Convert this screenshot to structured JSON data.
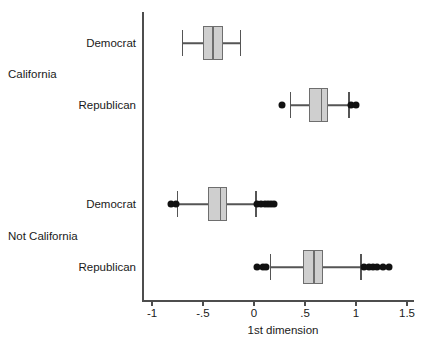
{
  "chart_data": {
    "type": "box",
    "title": "",
    "xlabel": "1st dimension",
    "ylabel": "",
    "orientation": "horizontal",
    "xlim": [
      -1.25,
      1.6
    ],
    "xticks": [
      -1,
      -0.5,
      0,
      0.5,
      1,
      1.5
    ],
    "xtick_labels": [
      "-1",
      "-.5",
      "0",
      ".5",
      "1",
      "1.5"
    ],
    "grid": false,
    "legend": false,
    "group_labels": [
      "California",
      "Not California"
    ],
    "category_labels": [
      "Democrat",
      "Republican",
      "Democrat",
      "Republican"
    ],
    "boxes": [
      {
        "group": "California",
        "category": "Democrat",
        "whisker_low": -0.7,
        "q1": -0.5,
        "median": -0.4,
        "q3": -0.3,
        "whisker_high": -0.13,
        "outliers": []
      },
      {
        "group": "California",
        "category": "Republican",
        "whisker_low": 0.36,
        "q1": 0.54,
        "median": 0.66,
        "q3": 0.73,
        "whisker_high": 0.93,
        "outliers": [
          0.27,
          0.95,
          1.0
        ]
      },
      {
        "group": "Not California",
        "category": "Democrat",
        "whisker_low": -0.75,
        "q1": -0.45,
        "median": -0.33,
        "q3": -0.26,
        "whisker_high": 0.02,
        "outliers": [
          -0.81,
          -0.76,
          0.03,
          0.07,
          0.11,
          0.14,
          0.17,
          0.2
        ]
      },
      {
        "group": "Not California",
        "category": "Republican",
        "whisker_low": 0.16,
        "q1": 0.48,
        "median": 0.59,
        "q3": 0.68,
        "whisker_high": 1.05,
        "outliers": [
          0.03,
          0.09,
          0.12,
          1.08,
          1.13,
          1.17,
          1.21,
          1.26,
          1.32
        ]
      }
    ],
    "colors": {
      "box_fill": "#cfcfcf",
      "box_edge": "#6e6e6e",
      "whisker": "#555555",
      "outlier": "#111111",
      "axis": "#4d4d4d",
      "text": "#1a1a1a"
    }
  }
}
